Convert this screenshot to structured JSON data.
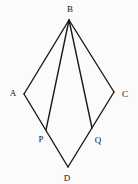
{
  "figure": {
    "name": "geometry-kite-with-cevians",
    "width": 138,
    "height": 184,
    "background": "#fbfbfb",
    "line_color": "#1a1a1a",
    "line_width": 1.4,
    "label_color": "#111111",
    "label_font_size": 9,
    "points": [
      {
        "id": "B",
        "label": "B",
        "x": 69,
        "y": 20,
        "label_x": 70,
        "label_y": 12
      },
      {
        "id": "A",
        "label": "A",
        "x": 24,
        "y": 94,
        "label_x": 13,
        "label_y": 96
      },
      {
        "id": "C",
        "label": "C",
        "x": 114,
        "y": 92,
        "label_x": 125,
        "label_y": 97
      },
      {
        "id": "D",
        "label": "D",
        "x": 68,
        "y": 167,
        "label_x": 67,
        "label_y": 181
      },
      {
        "id": "P",
        "label": "P",
        "x": 46,
        "y": 130,
        "label_x": 41,
        "label_y": 142
      },
      {
        "id": "Q",
        "label": "Q",
        "x": 92,
        "y": 128,
        "label_x": 98,
        "label_y": 143
      }
    ],
    "edges": [
      {
        "from": "B",
        "to": "A"
      },
      {
        "from": "B",
        "to": "P"
      },
      {
        "from": "B",
        "to": "Q"
      },
      {
        "from": "B",
        "to": "C"
      },
      {
        "from": "A",
        "to": "D"
      },
      {
        "from": "C",
        "to": "D"
      }
    ]
  }
}
